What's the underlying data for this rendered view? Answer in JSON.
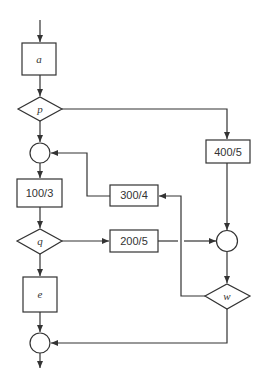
{
  "diagram": {
    "type": "flowchart",
    "colors": {
      "stroke": "#333333",
      "background": "#ffffff",
      "text": "#333333"
    },
    "nodes": {
      "a": {
        "label": "a",
        "shape": "rect"
      },
      "p": {
        "label": "p",
        "shape": "diamond"
      },
      "j1": {
        "label": "",
        "shape": "circle"
      },
      "b100": {
        "label": "100/3",
        "shape": "rect"
      },
      "q": {
        "label": "q",
        "shape": "diamond"
      },
      "e": {
        "label": "e",
        "shape": "rect"
      },
      "j3": {
        "label": "",
        "shape": "circle"
      },
      "b300": {
        "label": "300/4",
        "shape": "rect"
      },
      "b200": {
        "label": "200/5",
        "shape": "rect"
      },
      "b400": {
        "label": "400/5",
        "shape": "rect"
      },
      "j2": {
        "label": "",
        "shape": "circle"
      },
      "w": {
        "label": "w",
        "shape": "diamond"
      }
    },
    "edges": [
      {
        "from": "entry",
        "to": "a"
      },
      {
        "from": "a",
        "to": "p"
      },
      {
        "from": "p",
        "to": "j1"
      },
      {
        "from": "p",
        "to": "b400"
      },
      {
        "from": "j1",
        "to": "b100"
      },
      {
        "from": "b100",
        "to": "q"
      },
      {
        "from": "q",
        "to": "e"
      },
      {
        "from": "q",
        "to": "b200"
      },
      {
        "from": "e",
        "to": "j3"
      },
      {
        "from": "b300",
        "to": "j1"
      },
      {
        "from": "b200",
        "to": "j2"
      },
      {
        "from": "b400",
        "to": "j2"
      },
      {
        "from": "j2",
        "to": "w"
      },
      {
        "from": "w",
        "to": "b300"
      },
      {
        "from": "w",
        "to": "j3"
      },
      {
        "from": "j3",
        "to": "exit"
      }
    ]
  }
}
